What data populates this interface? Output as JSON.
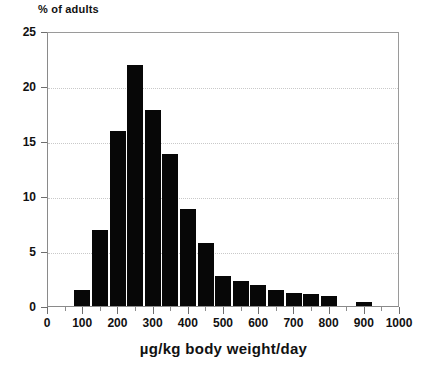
{
  "chart_data": {
    "type": "bar",
    "title": "",
    "ylabel": "% of adults",
    "xlabel": "µg/kg body weight/day",
    "xlim": [
      0,
      1000
    ],
    "ylim": [
      0,
      25
    ],
    "grid": "horizontal-dotted",
    "legend": "none",
    "bar_color": "#070707",
    "bin_width": 50,
    "y_ticks": [
      0,
      5,
      10,
      15,
      20,
      25
    ],
    "y_tick_labels": [
      "0",
      "5",
      "10",
      "15",
      "20",
      "25"
    ],
    "x_ticks": [
      0,
      100,
      200,
      300,
      400,
      500,
      600,
      700,
      800,
      900,
      1000
    ],
    "x_tick_labels": [
      "0",
      "100",
      "200",
      "300",
      "400",
      "500",
      "600",
      "700",
      "800",
      "900",
      "1000"
    ],
    "x_minor_ticks": [
      50,
      150,
      250,
      350,
      450,
      550,
      650,
      750,
      850,
      950
    ],
    "bin_starts": [
      75,
      125,
      175,
      225,
      275,
      325,
      375,
      425,
      475,
      525,
      575,
      625,
      675,
      725,
      775,
      875
    ],
    "bin_ends": [
      125,
      175,
      225,
      275,
      325,
      375,
      425,
      475,
      525,
      575,
      625,
      675,
      725,
      775,
      825,
      925
    ],
    "bin_centers": [
      100,
      150,
      200,
      250,
      300,
      350,
      400,
      450,
      500,
      550,
      600,
      650,
      700,
      750,
      800,
      900
    ],
    "values": [
      1.5,
      6.9,
      15.9,
      21.9,
      17.8,
      13.8,
      8.8,
      5.7,
      2.7,
      2.3,
      1.9,
      1.5,
      1.2,
      1.1,
      0.9,
      0.4
    ],
    "categories": [
      "75-125",
      "125-175",
      "175-225",
      "225-275",
      "275-325",
      "325-375",
      "375-425",
      "425-475",
      "475-525",
      "525-575",
      "575-625",
      "625-675",
      "675-725",
      "725-775",
      "775-825",
      "875-925"
    ]
  }
}
